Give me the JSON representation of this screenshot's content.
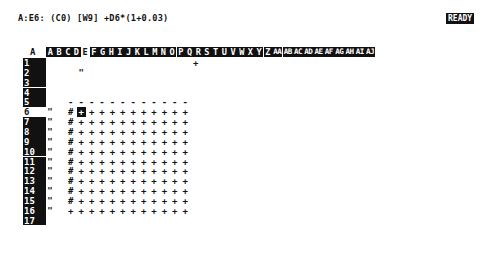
{
  "status_line": {
    "cell_info": "A:E6: (C0) [W9] +D6*(1+0.03)",
    "mode": "READY"
  },
  "sheet": {
    "corner_label": "A",
    "current_column": "E",
    "current_row": "6",
    "columns": [
      "A",
      "B",
      "C",
      "D",
      "E",
      "F",
      "G",
      "H",
      "I",
      "J",
      "K",
      "L",
      "M",
      "N",
      "O",
      "P",
      "Q",
      "R",
      "S",
      "T",
      "U",
      "V",
      "W",
      "X",
      "Y",
      "Z",
      "AA",
      "AB",
      "AC",
      "AD",
      "AE",
      "AF",
      "AG",
      "AH",
      "AI",
      "AJ"
    ],
    "rows": [
      "1",
      "2",
      "3",
      "4",
      "5",
      "6",
      "7",
      "8",
      "9",
      "10",
      "11",
      "12",
      "13",
      "14",
      "15",
      "16",
      "17"
    ],
    "cells": [
      {
        "col": "P",
        "row": "1",
        "value": "+"
      },
      {
        "col": "E",
        "row": "2",
        "value": "\""
      },
      {
        "col": "D",
        "row": "5",
        "value": "-"
      },
      {
        "col": "E",
        "row": "5",
        "value": "-"
      },
      {
        "col": "F",
        "row": "5",
        "value": "-"
      },
      {
        "col": "G",
        "row": "5",
        "value": "-"
      },
      {
        "col": "H",
        "row": "5",
        "value": "-"
      },
      {
        "col": "I",
        "row": "5",
        "value": "-"
      },
      {
        "col": "J",
        "row": "5",
        "value": "-"
      },
      {
        "col": "K",
        "row": "5",
        "value": "-"
      },
      {
        "col": "L",
        "row": "5",
        "value": "-"
      },
      {
        "col": "M",
        "row": "5",
        "value": "-"
      },
      {
        "col": "N",
        "row": "5",
        "value": "-"
      },
      {
        "col": "O",
        "row": "5",
        "value": "-"
      }
    ],
    "block": {
      "rows_from": 6,
      "rows_to": 16,
      "col_b_value": "\"",
      "col_d_value": "#",
      "col_d_last_row_value": "+",
      "fill_value": "+",
      "fill_columns": [
        "E",
        "F",
        "G",
        "H",
        "I",
        "J",
        "K",
        "L",
        "M",
        "N",
        "O"
      ]
    },
    "cursor_cell": {
      "col": "E",
      "row": "6",
      "value": "+"
    }
  }
}
